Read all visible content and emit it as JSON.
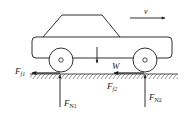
{
  "diagram": {
    "title": "",
    "colors": {
      "stroke": "#1a1a1a",
      "background": "#ffffff",
      "hatch": "#555555"
    },
    "labels": {
      "velocity": "v",
      "weight": "W",
      "friction_front": {
        "main": "F",
        "sub": "f1"
      },
      "friction_rear": {
        "main": "F",
        "sub": "f2"
      },
      "normal_front": {
        "main": "F",
        "sub": "N1"
      },
      "normal_rear": {
        "main": "F",
        "sub": "N2"
      }
    },
    "forces": [
      {
        "name": "F_f1",
        "direction": "left",
        "at": "left wheel contact"
      },
      {
        "name": "F_f2",
        "direction": "left",
        "at": "right wheel contact"
      },
      {
        "name": "F_N1",
        "direction": "up",
        "at": "left wheel contact"
      },
      {
        "name": "F_N2",
        "direction": "up",
        "at": "right wheel contact"
      },
      {
        "name": "W",
        "direction": "down",
        "at": "center of mass"
      },
      {
        "name": "v",
        "direction": "right",
        "at": "above car"
      }
    ]
  }
}
